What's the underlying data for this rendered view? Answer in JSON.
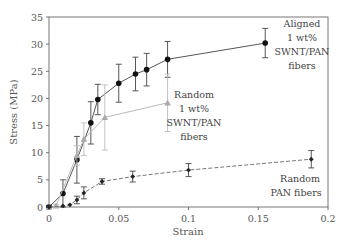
{
  "chart_data": {
    "type": "line",
    "title": "",
    "xlabel": "Strain",
    "ylabel": "Stress (MPa)",
    "xlim": [
      0,
      0.2
    ],
    "ylim": [
      0,
      35
    ],
    "xticks": [
      0,
      0.05,
      0.1,
      0.15,
      0.2
    ],
    "xtick_labels": [
      "0",
      "0.05",
      "0.1",
      "0.15",
      "0.2"
    ],
    "yticks": [
      0,
      5,
      10,
      15,
      20,
      25,
      30,
      35
    ],
    "ytick_labels": [
      "0",
      "5",
      "10",
      "15",
      "20",
      "25",
      "30",
      "35"
    ],
    "grid": false,
    "legend": "none (inline annotations)",
    "series": [
      {
        "name": "Aligned 1 wt% SWNT/PAN fibers",
        "marker": "circle",
        "color": "#111111",
        "line_color": "#555555",
        "line_style": "solid",
        "x": [
          0,
          0.01,
          0.02,
          0.03,
          0.035,
          0.05,
          0.062,
          0.07,
          0.085,
          0.155
        ],
        "y": [
          0,
          2.5,
          8.7,
          15.5,
          19.8,
          22.8,
          24.5,
          25.3,
          27.2,
          30.2
        ],
        "err": [
          0.3,
          2.5,
          4.3,
          3.9,
          2.8,
          3.5,
          3.1,
          3.0,
          3.3,
          2.7
        ]
      },
      {
        "name": "Random 1 wt% SWNT/PAN fibers",
        "marker": "triangle",
        "color": "#aaaaaa",
        "line_color": "#bbbbbb",
        "line_style": "solid",
        "x": [
          0,
          0.005,
          0.02,
          0.025,
          0.04,
          0.085
        ],
        "y": [
          0,
          0.2,
          9.5,
          12.5,
          16.5,
          19.2
        ],
        "err": [
          0.2,
          0.3,
          1.8,
          3.0,
          6.0,
          5.3
        ]
      },
      {
        "name": "Random PAN fibers",
        "marker": "diamond",
        "color": "#222222",
        "line_color": "#777777",
        "line_style": "dashed",
        "x": [
          0,
          0.01,
          0.015,
          0.02,
          0.025,
          0.038,
          0.06,
          0.1,
          0.188
        ],
        "y": [
          0,
          0.2,
          0.4,
          1.3,
          2.6,
          4.7,
          5.6,
          6.8,
          8.8
        ],
        "err": [
          0.1,
          0.1,
          0.2,
          0.7,
          1.1,
          0.5,
          1.0,
          1.2,
          1.6
        ]
      }
    ],
    "annotations": [
      {
        "lines": [
          "Aligned",
          "1 wt%",
          "SWNT/PAN",
          "fibers"
        ],
        "series": "Aligned 1 wt% SWNT/PAN fibers"
      },
      {
        "lines": [
          "Random",
          "1 wt%",
          "SWNT/PAN",
          "fibers"
        ],
        "series": "Random 1 wt% SWNT/PAN fibers"
      },
      {
        "lines": [
          "Random",
          "PAN fibers"
        ],
        "series": "Random PAN fibers"
      }
    ]
  }
}
